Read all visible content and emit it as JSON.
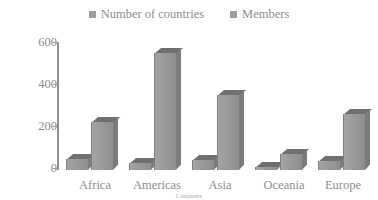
{
  "chart_data": {
    "type": "bar",
    "title": "",
    "subtitle": "",
    "xlabel": "Continents",
    "ylabel": "",
    "categories": [
      "Africa",
      "Americas",
      "Asia",
      "Oceania",
      "Europe"
    ],
    "series": [
      {
        "name": "Number of countries",
        "values": [
          54,
          35,
          47,
          16,
          44
        ]
      },
      {
        "name": "Members",
        "values": [
          230,
          555,
          355,
          75,
          265
        ]
      }
    ],
    "ylim": [
      0,
      600
    ],
    "yticks": [
      0,
      200,
      400,
      600
    ],
    "ytick_labels": [
      "0",
      "200",
      "400",
      "600"
    ],
    "grid": false,
    "legend_position": "top-center",
    "style": "3d-grouped-bars-grayscale"
  },
  "legend": {
    "entries": [
      {
        "label": "Number of countries",
        "color": "#9d9d9d"
      },
      {
        "label": "Members",
        "color": "#9d9d9d"
      }
    ]
  },
  "axes": {
    "y_tick_labels": [
      "600",
      "400",
      "200",
      "0"
    ],
    "x_categories": [
      "Africa",
      "Americas",
      "Asia",
      "Oceania",
      "Europe"
    ],
    "x_title": "Continents"
  },
  "colors": {
    "bar_front": "#9a9a9a",
    "bar_top": "#6f6f6f",
    "bar_side": "#7c7c7c",
    "axis": "#8f8f8f",
    "text": "#8d8d8d",
    "background": "#ffffff"
  }
}
